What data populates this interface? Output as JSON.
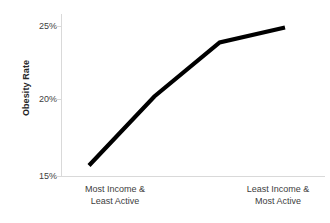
{
  "chart_data": {
    "type": "line",
    "title": "",
    "xlabel": "",
    "ylabel": "Obesity Rate",
    "ylim": [
      15,
      25
    ],
    "y_ticks": [
      "15%",
      "20%",
      "25%"
    ],
    "y_tick_values": [
      15,
      20,
      25
    ],
    "grid": false,
    "legend": "none",
    "line_color": "#000000",
    "axis_color": "#d9d9d9",
    "x_category_labels": [
      {
        "line1": "Most Income &",
        "line2": "Least Active"
      },
      {
        "line1": "Least Income &",
        "line2": "Most Active"
      }
    ],
    "series": [
      {
        "name": "Obesity Rate",
        "x": [
          0,
          1,
          2,
          3
        ],
        "values": [
          15.7,
          20.3,
          23.9,
          24.9
        ]
      }
    ],
    "annotations": []
  },
  "axis": {
    "y_title": "Obesity Rate",
    "y_tick_25": "25%",
    "y_tick_20": "20%",
    "y_tick_15": "15%"
  },
  "x_axis": {
    "left_line1": "Most Income &",
    "left_line2": "Least Active",
    "right_line1": "Least Income &",
    "right_line2": "Most Active"
  }
}
